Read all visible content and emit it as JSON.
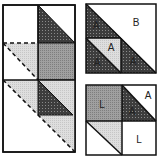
{
  "diagram": {
    "colors": {
      "dark": "#4a4a4a",
      "medium": "#9a9a9a",
      "light": "#d8d8d8",
      "white": "#ffffff",
      "line": "#111111"
    },
    "left_panel": {
      "description": "Exploded block layout with dashed fold/cut lines"
    },
    "top_right_block": {
      "labels": [
        "B",
        "A",
        "A",
        "A",
        "A"
      ]
    },
    "bottom_right_block": {
      "labels": [
        "L",
        "A",
        "A",
        "L"
      ]
    }
  }
}
